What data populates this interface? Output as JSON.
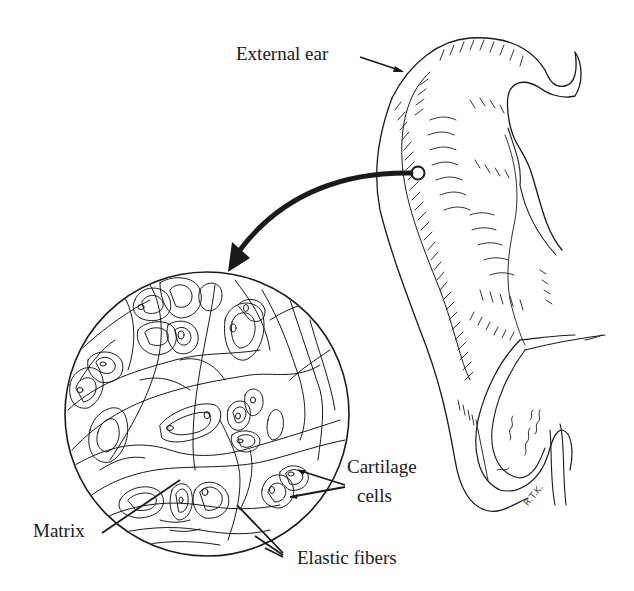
{
  "figure": {
    "labels": {
      "external_ear": "External ear",
      "cartilage_cells_line1": "Cartilage",
      "cartilage_cells_line2": "cells",
      "matrix": "Matrix",
      "elastic_fibers": "Elastic fibers"
    },
    "artist_signature": "R.T.K.",
    "colors": {
      "ink": "#1a1a1a",
      "background": "#ffffff"
    }
  }
}
